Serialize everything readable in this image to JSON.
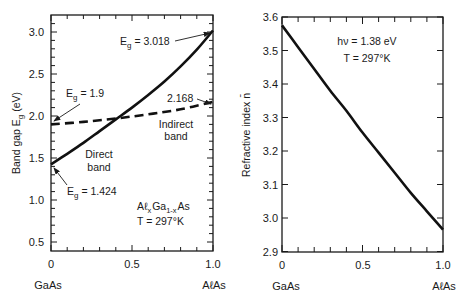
{
  "chart_data": [
    {
      "type": "line",
      "title": "",
      "xlabel": "",
      "ylabel": "Band gap E_g (eV)",
      "xlim": [
        0,
        1.0
      ],
      "ylim": [
        0.4,
        3.15
      ],
      "x_ticks": [
        "0",
        "0.5",
        "1.0"
      ],
      "y_ticks": [
        "0.5",
        "1.0",
        "1.5",
        "2.0",
        "2.5",
        "3.0"
      ],
      "x_end_labels": {
        "left": "GaAs",
        "right": "AℓAs"
      },
      "grid": false,
      "series": [
        {
          "name": "Direct band",
          "style": "solid",
          "x": [
            0,
            0.1,
            0.2,
            0.3,
            0.4,
            0.5,
            0.6,
            0.7,
            0.8,
            0.9,
            1.0
          ],
          "values": [
            1.424,
            1.55,
            1.68,
            1.82,
            1.96,
            2.1,
            2.25,
            2.41,
            2.59,
            2.79,
            3.018
          ]
        },
        {
          "name": "Indirect band",
          "style": "dashed",
          "x": [
            0,
            0.2,
            0.4,
            0.6,
            0.8,
            1.0
          ],
          "values": [
            1.9,
            1.93,
            1.97,
            2.02,
            2.08,
            2.168
          ]
        }
      ],
      "annotations": {
        "eg_top": {
          "prefix": "E",
          "sub": "g",
          "text": " = 3.018"
        },
        "eg_indirect_start": {
          "prefix": "E",
          "sub": "g",
          "text": " = 1.9"
        },
        "indirect_end": "2.168",
        "eg_direct_start": {
          "prefix": "E",
          "sub": "g",
          "text": " = 1.424"
        },
        "direct_label": [
          "Direct",
          "band"
        ],
        "indirect_label": [
          "Indirect",
          "band"
        ],
        "material": {
          "a": "Aℓ",
          "x": "x",
          "b": "Ga",
          "x2": "1-x",
          "c": "As"
        },
        "temperature": "T = 297°K"
      }
    },
    {
      "type": "line",
      "title": "",
      "xlabel": "",
      "ylabel": "Refractive index n̄",
      "xlim": [
        0,
        1.0
      ],
      "ylim": [
        2.9,
        3.6
      ],
      "x_ticks": [
        "0",
        "0.5",
        "1.0"
      ],
      "y_ticks": [
        "2.9",
        "3.0",
        "3.1",
        "3.2",
        "3.3",
        "3.4",
        "3.5",
        "3.6"
      ],
      "x_end_labels": {
        "left": "GaAs",
        "right": "AℓAs"
      },
      "grid": false,
      "series": [
        {
          "name": "Refractive index",
          "style": "solid",
          "x": [
            0,
            0.1,
            0.2,
            0.3,
            0.4,
            0.5,
            0.6,
            0.7,
            0.8,
            0.9,
            1.0
          ],
          "values": [
            3.575,
            3.51,
            3.445,
            3.38,
            3.32,
            3.255,
            3.195,
            3.135,
            3.075,
            3.02,
            2.965
          ]
        }
      ],
      "annotations": {
        "photon_energy": "hν = 1.38 eV",
        "temperature": "T = 297°K"
      }
    }
  ]
}
